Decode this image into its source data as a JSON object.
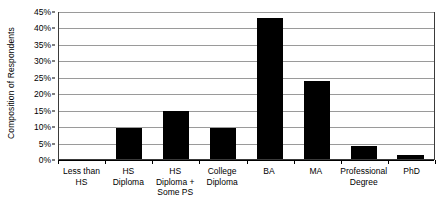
{
  "chart_data": {
    "type": "bar",
    "title": "",
    "xlabel": "",
    "ylabel": "Composition of Respondents",
    "categories": [
      "Less than HS",
      "HS Diploma",
      "HS Diploma + Some PS",
      "College Diploma",
      "BA",
      "MA",
      "Professional Degree",
      "PhD"
    ],
    "values": [
      0,
      9.5,
      14.5,
      9.5,
      43,
      23.8,
      4,
      1.3
    ],
    "ylim": [
      0,
      45
    ],
    "ytick_labels": [
      "45%",
      "40%",
      "35%",
      "30%",
      "25%",
      "20%",
      "15%",
      "10%",
      "5%",
      "0%"
    ],
    "ytick_values": [
      45,
      40,
      35,
      30,
      25,
      20,
      15,
      10,
      5,
      0
    ],
    "grid": true,
    "legend": false,
    "bar_color": "#000000",
    "gridline_color": "#9a9a9a",
    "axis_color": "#000000",
    "background_color": "#ffffff"
  }
}
